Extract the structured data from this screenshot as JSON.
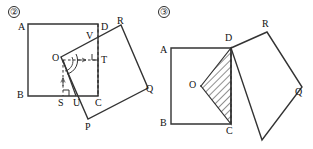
{
  "figure": {
    "width": 313,
    "height": 149,
    "background": "#ffffff",
    "stroke_color": "#333333",
    "label_color": "#111111"
  },
  "panels": [
    {
      "id": "panel-2",
      "number_label": "②",
      "description": "Square ABCD with center O and an overlapping square RQPV rotated about O",
      "square": {
        "name": "ABCD",
        "vertices": [
          {
            "label": "A",
            "x": 28,
            "y": 24,
            "label_x": 18,
            "label_y": 27
          },
          {
            "label": "D",
            "x": 98,
            "y": 24,
            "label_x": 101,
            "label_y": 27
          },
          {
            "label": "C",
            "x": 98,
            "y": 96,
            "label_x": 96,
            "label_y": 107
          },
          {
            "label": "B",
            "x": 28,
            "y": 96,
            "label_x": 18,
            "label_y": 99
          }
        ]
      },
      "center": {
        "label": "O",
        "x": 63,
        "y": 60,
        "label_x": 53,
        "label_y": 62
      },
      "rotated_square": {
        "name": "RQPV",
        "vertices": [
          {
            "label": "R",
            "x": 121,
            "y": 25,
            "label_x": 118,
            "label_y": 21
          },
          {
            "label": "Q",
            "x": 148,
            "y": 88,
            "label_x": 149,
            "label_y": 91
          },
          {
            "label": "P",
            "x": 88,
            "y": 119,
            "label_x": 86,
            "label_y": 130
          },
          {
            "label": "",
            "x": 61,
            "y": 57,
            "label_x": 0,
            "label_y": 0
          }
        ]
      },
      "intersections": [
        {
          "label": "V",
          "x": 93,
          "y": 38,
          "label_x": 87,
          "label_y": 37
        },
        {
          "label": "U",
          "x": 76,
          "y": 96,
          "label_x": 73,
          "label_y": 107
        }
      ],
      "feet": [
        {
          "label": "S",
          "x": 63,
          "y": 96,
          "label_x": 59,
          "label_y": 107
        },
        {
          "label": "T",
          "x": 98,
          "y": 60,
          "label_x": 102,
          "label_y": 63
        }
      ],
      "markers": {
        "right_angle_at": [
          "S",
          "T"
        ],
        "arc_at": "O",
        "dashed_segments": [
          "O-S",
          "O-T",
          "T-C",
          "D-C"
        ],
        "arrow_ticks": [
          "O-S",
          "O-T"
        ]
      }
    },
    {
      "id": "panel-3",
      "number_label": "③",
      "description": "Square ABCD with center O, overlapping square rotated 45 degrees, triangle ODC shaded with hatching",
      "square": {
        "name": "ABCD",
        "vertices": [
          {
            "label": "A",
            "x": 171,
            "y": 48,
            "label_x": 160,
            "label_y": 51
          },
          {
            "label": "D",
            "x": 231,
            "y": 48,
            "label_x": 226,
            "label_y": 40
          },
          {
            "label": "C",
            "x": 231,
            "y": 124,
            "label_x": 227,
            "label_y": 136
          },
          {
            "label": "B",
            "x": 171,
            "y": 124,
            "label_x": 160,
            "label_y": 127
          }
        ]
      },
      "center": {
        "label": "O",
        "x": 201,
        "y": 86,
        "label_x": 190,
        "label_y": 89
      },
      "rotated_square": {
        "name": "DRQP",
        "vertices": [
          {
            "label": "R",
            "x": 267,
            "y": 32,
            "label_x": 263,
            "label_y": 28
          },
          {
            "label": "Q",
            "x": 302,
            "y": 87,
            "label_x": 296,
            "label_y": 93
          },
          {
            "label": "",
            "x": 262,
            "y": 140,
            "label_x": 0,
            "label_y": 0
          }
        ]
      },
      "shaded_triangle": {
        "name": "ODC",
        "points": "201,86 231,48 231,124",
        "hatch_color": "#333333",
        "fill": "#ffffff"
      },
      "markers": {
        "dashed_segments": [
          "D-C"
        ]
      }
    }
  ]
}
